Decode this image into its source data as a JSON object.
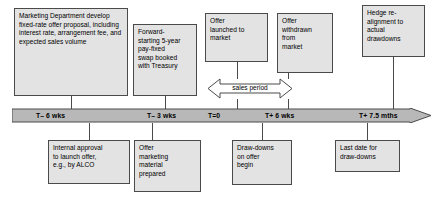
{
  "diagram": {
    "colors": {
      "box_fill": "#e3e3e3",
      "box_border": "#4a4a4a",
      "timeline_fill": "#b8b8b8",
      "timeline_border": "#4a4a4a",
      "text": "#000000"
    },
    "top_boxes": [
      {
        "id": "marketing-department",
        "text": "Marketing Department develop fixed-rate offer proposal, including interest rate, arrangement fee, and expected sales volume"
      },
      {
        "id": "forward-starting-swap",
        "text": "Forward-\nstarting 5-year\npay-fixed\nswap booked\nwith Treasury"
      },
      {
        "id": "offer-launched",
        "text": "Offer\nlaunched to\nmarket"
      },
      {
        "id": "offer-withdrawn",
        "text": "Offer\nwithdrawn\nfrom\nmarket"
      },
      {
        "id": "hedge-realignment",
        "text": "Hedge re-\nalignment to\nactual\ndrawdowns"
      }
    ],
    "bottom_boxes": [
      {
        "id": "internal-approval",
        "text": "Internal approval\nto launch offer,\ne.g., by ALCO"
      },
      {
        "id": "offer-marketing-material",
        "text": "Offer\nmarketing\nmaterial\nprepared"
      },
      {
        "id": "drawdowns-begin",
        "text": "Draw-downs\non offer\nbegin"
      },
      {
        "id": "last-date-drawdowns",
        "text": "Last date for\ndraw-downs"
      }
    ],
    "timeline": {
      "ticks": [
        {
          "id": "t-minus-6-wks",
          "label": "T– 6 wks"
        },
        {
          "id": "t-minus-3-wks",
          "label": "T– 3 wks"
        },
        {
          "id": "t-zero",
          "label": "T=0"
        },
        {
          "id": "t-plus-6-wks",
          "label": "T+ 6 wks"
        },
        {
          "id": "t-plus-7-5-mths",
          "label": "T+ 7.5 mths"
        }
      ]
    },
    "annotations": {
      "sales_period": "sales period"
    }
  }
}
